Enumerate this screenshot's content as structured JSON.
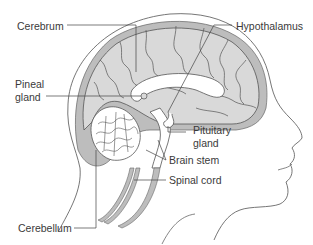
{
  "diagram": {
    "colors": {
      "brain_fill": "#d9d9d9",
      "tissue_fill": "#bdbdbd",
      "outline": "#555555",
      "leader_line": "#444444",
      "label_text": "#3a3a3a",
      "background": "#ffffff"
    },
    "labels": {
      "cerebrum": "Cerebrum",
      "hypothalamus": "Hypothalamus",
      "pineal_line1": "Pineal",
      "pineal_line2": "gland",
      "pituitary_line1": "Pituitary",
      "pituitary_line2": "gland",
      "brain_stem": "Brain stem",
      "spinal_cord": "Spinal cord",
      "cerebellum": "Cerebellum"
    }
  }
}
